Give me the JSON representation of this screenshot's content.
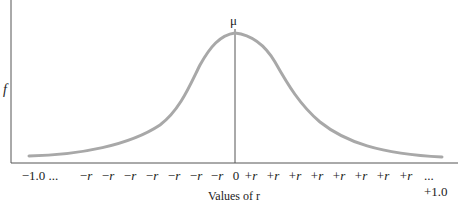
{
  "chart_data": {
    "type": "line",
    "title": "",
    "xlabel": "Values of r",
    "ylabel": "f",
    "peak_label": "μ",
    "x_tick_labels": [
      "−1.0 ...",
      "−r",
      "−r",
      "−r",
      "−r",
      "−r",
      "−r",
      "−r",
      "−r",
      "0",
      "+r",
      "+r",
      "+r",
      "+r",
      "+r",
      "+r",
      "+r",
      "+r",
      "... +1.0"
    ],
    "curve": "bell-shaped (normal) distribution centered at 0",
    "series": [
      {
        "name": "sampling distribution of r",
        "x": [
          -1.0,
          -0.8,
          -0.6,
          -0.4,
          -0.3,
          -0.2,
          -0.1,
          0,
          0.1,
          0.2,
          0.3,
          0.4,
          0.6,
          0.8,
          1.0
        ],
        "values": [
          0.03,
          0.08,
          0.2,
          0.45,
          0.65,
          0.85,
          0.97,
          1.0,
          0.97,
          0.85,
          0.65,
          0.45,
          0.2,
          0.08,
          0.03
        ]
      }
    ],
    "xlim": [
      -1.0,
      1.0
    ],
    "grid": false,
    "legend": null
  },
  "colors": {
    "curve": "#a8a8a8",
    "axis": "#555555",
    "text": "#222222"
  }
}
